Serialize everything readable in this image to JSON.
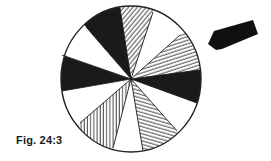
{
  "figure": {
    "caption": "Fig. 24:3",
    "colors": {
      "ink": "#1a1a1a",
      "paper": "#ffffff",
      "outline": "#222222"
    },
    "disc": {
      "cx": 131,
      "cy": 79,
      "rx": 70,
      "ry": 73
    },
    "segments": [
      {
        "name": "segment-left-black",
        "fill": "black",
        "points": [
          [
            62,
            55
          ],
          [
            60,
            70
          ],
          [
            62,
            91
          ]
        ]
      },
      {
        "name": "segment-left-lower-white",
        "fill": "white",
        "points": [
          [
            62,
            91
          ],
          [
            68,
            108
          ],
          [
            80,
            123
          ]
        ]
      },
      {
        "name": "segment-lower-left-vertical-hatch",
        "fill": "hatch-vertical",
        "points": [
          [
            80,
            123
          ],
          [
            95,
            138
          ],
          [
            113,
            148
          ]
        ]
      },
      {
        "name": "segment-bottom-white",
        "fill": "white",
        "points": [
          [
            113,
            148
          ],
          [
            128,
            152
          ],
          [
            143,
            151
          ]
        ]
      },
      {
        "name": "segment-lower-right-diagonal-hatch",
        "fill": "hatch-shallow-down",
        "points": [
          [
            143,
            151
          ],
          [
            162,
            143
          ],
          [
            177,
            131
          ]
        ]
      },
      {
        "name": "segment-right-lower-white",
        "fill": "white",
        "points": [
          [
            177,
            131
          ],
          [
            190,
            118
          ],
          [
            197,
            103
          ]
        ]
      },
      {
        "name": "segment-right-black",
        "fill": "black",
        "points": [
          [
            197,
            103
          ],
          [
            201,
            86
          ],
          [
            199,
            70
          ]
        ]
      },
      {
        "name": "segment-upper-right-hatch",
        "fill": "hatch-shallow-up",
        "points": [
          [
            199,
            70
          ],
          [
            192,
            50
          ],
          [
            180,
            35
          ]
        ]
      },
      {
        "name": "segment-upper-right-white",
        "fill": "white",
        "points": [
          [
            180,
            35
          ],
          [
            168,
            21
          ],
          [
            153,
            12
          ]
        ]
      },
      {
        "name": "segment-top-diagonal-hatch",
        "fill": "hatch-diagonal",
        "points": [
          [
            153,
            12
          ],
          [
            137,
            6
          ],
          [
            120,
            8
          ]
        ]
      },
      {
        "name": "segment-top-left-black",
        "fill": "black",
        "points": [
          [
            120,
            8
          ],
          [
            102,
            15
          ],
          [
            86,
            27
          ]
        ]
      },
      {
        "name": "segment-upper-left-white",
        "fill": "white",
        "points": [
          [
            86,
            27
          ],
          [
            73,
            40
          ],
          [
            62,
            55
          ]
        ]
      }
    ],
    "arrow": {
      "points": [
        [
          208,
          44
        ],
        [
          214,
          31
        ],
        [
          253,
          20
        ],
        [
          258,
          34
        ],
        [
          222,
          49
        ],
        [
          216,
          50
        ]
      ],
      "direction": "pointing-left-down-toward-disc"
    }
  }
}
